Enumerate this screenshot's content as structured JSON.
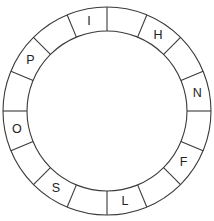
{
  "wheel": {
    "segment_count": 16,
    "center": [
      107,
      111
    ],
    "outer_radius": 104,
    "inner_radius": 80,
    "line_color": "#3a3a3a",
    "text_color": "#222222",
    "direction": "clockwise from top",
    "segments": [
      {
        "index": 0,
        "letter": ""
      },
      {
        "index": 1,
        "letter": "H"
      },
      {
        "index": 2,
        "letter": ""
      },
      {
        "index": 3,
        "letter": "N"
      },
      {
        "index": 4,
        "letter": ""
      },
      {
        "index": 5,
        "letter": "F"
      },
      {
        "index": 6,
        "letter": ""
      },
      {
        "index": 7,
        "letter": "L"
      },
      {
        "index": 8,
        "letter": ""
      },
      {
        "index": 9,
        "letter": "S"
      },
      {
        "index": 10,
        "letter": ""
      },
      {
        "index": 11,
        "letter": "O"
      },
      {
        "index": 12,
        "letter": ""
      },
      {
        "index": 13,
        "letter": "P"
      },
      {
        "index": 14,
        "letter": ""
      },
      {
        "index": 15,
        "letter": "I"
      }
    ]
  }
}
